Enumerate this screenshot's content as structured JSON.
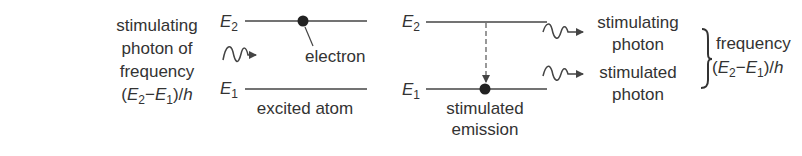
{
  "diagram": {
    "colors": {
      "ink": "#333333",
      "background": "#ffffff"
    },
    "left_panel": {
      "incoming_photon_label": {
        "line1": "stimulating",
        "line2": "photon of",
        "line3": "frequency",
        "line4_open": "(",
        "line4_e2": "E",
        "line4_e2_sub": "2",
        "line4_minus": "−",
        "line4_e1": "E",
        "line4_e1_sub": "1",
        "line4_close": ")/",
        "line4_h": "h"
      },
      "upper_level": {
        "symbol": "E",
        "sub": "2"
      },
      "lower_level": {
        "symbol": "E",
        "sub": "1"
      },
      "electron_label": "electron",
      "caption": "excited atom"
    },
    "right_panel": {
      "upper_level": {
        "symbol": "E",
        "sub": "2"
      },
      "lower_level": {
        "symbol": "E",
        "sub": "1"
      },
      "caption_line1": "stimulated",
      "caption_line2": "emission"
    },
    "outgoing": {
      "photon1_line1": "stimulating",
      "photon1_line2": "photon",
      "photon2_line1": "stimulated",
      "photon2_line2": "photon",
      "frequency_label": {
        "line1": "frequency",
        "line2_open": "(",
        "line2_e2": "E",
        "line2_e2_sub": "2",
        "line2_minus": "−",
        "line2_e1": "E",
        "line2_e1_sub": "1",
        "line2_close": ")/",
        "line2_h": "h"
      }
    }
  }
}
